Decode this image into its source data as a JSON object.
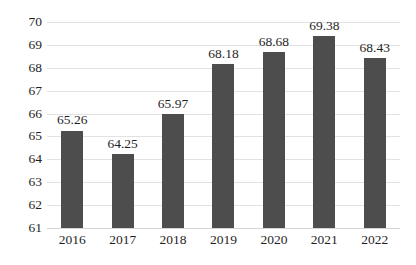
{
  "chart_data": {
    "type": "bar",
    "title": "",
    "subtitle": "",
    "xlabel": "",
    "ylabel": "",
    "categories": [
      "2016",
      "2017",
      "2018",
      "2019",
      "2020",
      "2021",
      "2022"
    ],
    "values": [
      65.26,
      64.25,
      65.97,
      68.18,
      68.68,
      69.38,
      68.43
    ],
    "data_labels": [
      "65.26",
      "64.25",
      "65.97",
      "68.18",
      "68.68",
      "69.38",
      "68.43"
    ],
    "ylim": [
      61,
      70
    ],
    "ytick_step": 1,
    "ytick_labels": [
      "70",
      "69",
      "68",
      "67",
      "66",
      "65",
      "64",
      "63",
      "62",
      "61"
    ],
    "ytick_values": [
      70,
      69,
      68,
      67,
      66,
      65,
      64,
      63,
      62,
      61
    ],
    "grid": true,
    "grid_axis": "y",
    "legend": false,
    "legend_position": "none",
    "series": [
      {
        "name": "",
        "values": [
          65.26,
          64.25,
          65.97,
          68.18,
          68.68,
          69.38,
          68.43
        ]
      }
    ],
    "colors": {
      "bar": "#4d4d4d",
      "gridline": "#e2e2e2",
      "baseline": "#d6d6d6",
      "text": "#1f1f1f",
      "background": "#ffffff"
    }
  }
}
